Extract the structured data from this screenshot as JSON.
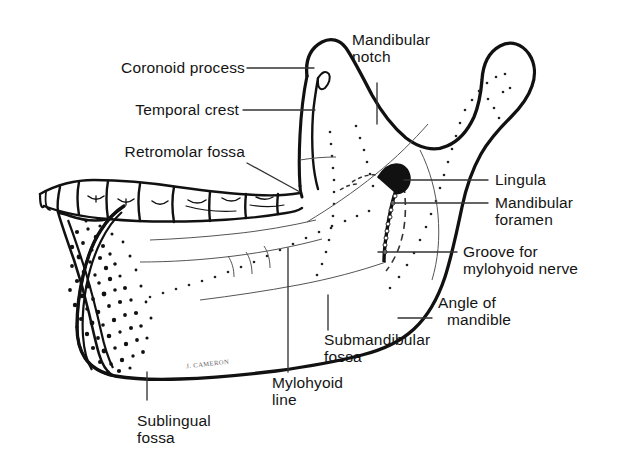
{
  "figure": {
    "signature": "J. CAMERON",
    "background_color": "#ffffff",
    "ink_color": "#111111"
  },
  "labels": {
    "coronoid_process": "Coronoid process",
    "temporal_crest": "Temporal crest",
    "retromolar_fossa": "Retromolar fossa",
    "mandibular_notch_line1": "Mandibular",
    "mandibular_notch_line2": "notch",
    "lingula": "Lingula",
    "mandibular_foramen_line1": "Mandibular",
    "mandibular_foramen_line2": "foramen",
    "groove_line1": "Groove for",
    "groove_line2": "mylohyoid nerve",
    "angle_line1": "Angle of",
    "angle_line2": "mandible",
    "submandibular_fossa_line1": "Submandibular",
    "submandibular_fossa_line2": "fossa",
    "mylohyoid_line_line1": "Mylohyoid",
    "mylohyoid_line_line2": "line",
    "sublingual_fossa_line1": "Sublingual",
    "sublingual_fossa_line2": "fossa"
  }
}
